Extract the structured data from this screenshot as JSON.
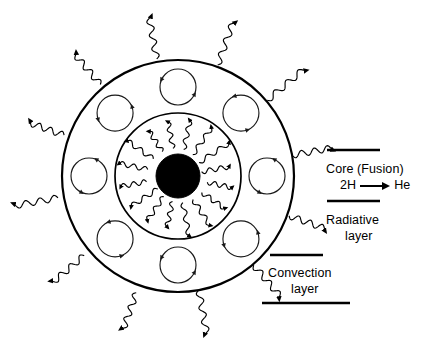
{
  "diagram": {
    "background_color": "#ffffff",
    "stroke_color": "#000000",
    "core_fill_color": "#000000",
    "geometry": {
      "center_x": 178,
      "center_y": 176,
      "core_radius": 22,
      "radiative_boundary_radius": 63,
      "outer_boundary_radius": 116,
      "convection_cell_radius": 18,
      "convection_cell_orbit_radius": 89,
      "convection_cell_count": 8
    }
  },
  "labels": {
    "core": {
      "title": "Core (Fusion)",
      "reactant": "2H",
      "arrow": "arrow-right",
      "product": "He",
      "leader_line": {
        "x1": 327,
        "y1": 150,
        "x2": 380,
        "y2": 150
      }
    },
    "radiative": {
      "line1": "Radiative",
      "line2": "layer",
      "leader_line": {
        "x1": 327,
        "y1": 201,
        "x2": 380,
        "y2": 201
      }
    },
    "convection": {
      "line1": "Convection",
      "line2": "layer",
      "leader_line_top": {
        "x1": 270,
        "y1": 255,
        "x2": 323,
        "y2": 255
      },
      "leader_line_bottom": {
        "x1": 262,
        "y1": 303,
        "x2": 350,
        "y2": 303
      }
    }
  },
  "radiative_rays": {
    "description": "wavy photon rays emitted from the core through the radiative layer",
    "count": 16,
    "start_radius": 28,
    "end_radius": 58
  },
  "emitted_rays": {
    "description": "wavy radiation arrows emitted outward from the sun surface",
    "count": 12,
    "start_radius": 120,
    "end_radius": 163
  },
  "convection_cells": {
    "description": "circulating convection cells with rotation arrowheads",
    "angles_deg": [
      90,
      45,
      0,
      315,
      270,
      225,
      180,
      135
    ]
  }
}
